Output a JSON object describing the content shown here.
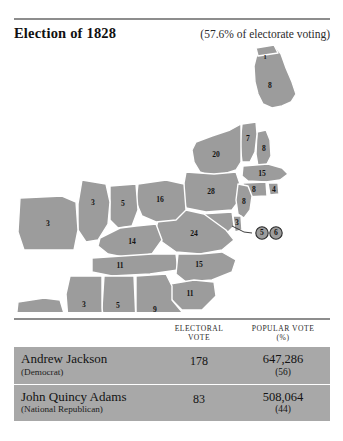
{
  "header": {
    "title": "Election of 1828",
    "turnout_note": "(57.6% of electorate voting)"
  },
  "map": {
    "fill_color": "#9c9c9c",
    "border_color": "#ffffff",
    "states": [
      {
        "code": "ME",
        "name": "Maine",
        "electoral_votes": "8",
        "x": 270,
        "y": 42
      },
      {
        "code": "MEn",
        "name": "Maine (split)",
        "electoral_votes": "1",
        "x": 265,
        "y": 14
      },
      {
        "code": "VT",
        "name": "Vermont",
        "electoral_votes": "7",
        "x": 248,
        "y": 89
      },
      {
        "code": "NH",
        "name": "New Hampshire",
        "electoral_votes": "8",
        "x": 264,
        "y": 105
      },
      {
        "code": "NY",
        "name": "New York",
        "electoral_votes": "20",
        "x": 224,
        "y": 111
      },
      {
        "code": "MA",
        "name": "Massachusetts",
        "electoral_votes": "15",
        "x": 265,
        "y": 130
      },
      {
        "code": "CT",
        "name": "Connecticut",
        "electoral_votes": "8",
        "x": 254,
        "y": 145
      },
      {
        "code": "RI",
        "name": "Rhode Island",
        "electoral_votes": "4",
        "x": 273,
        "y": 145
      },
      {
        "code": "PA",
        "name": "Pennsylvania",
        "electoral_votes": "28",
        "x": 211,
        "y": 148
      },
      {
        "code": "NJ",
        "name": "New Jersey",
        "electoral_votes": "8",
        "x": 244,
        "y": 161
      },
      {
        "code": "DE",
        "name": "Delaware",
        "electoral_votes": "3",
        "x": 237,
        "y": 180
      },
      {
        "code": "VA",
        "name": "Virginia",
        "electoral_votes": "24",
        "x": 197,
        "y": 190
      },
      {
        "code": "OH",
        "name": "Ohio",
        "electoral_votes": "16",
        "x": 158,
        "y": 158
      },
      {
        "code": "IN",
        "name": "Indiana",
        "electoral_votes": "5",
        "x": 122,
        "y": 163
      },
      {
        "code": "IL",
        "name": "Illinois",
        "electoral_votes": "3",
        "x": 95,
        "y": 160
      },
      {
        "code": "MO",
        "name": "Missouri",
        "electoral_votes": "3",
        "x": 61,
        "y": 182
      },
      {
        "code": "KY",
        "name": "Kentucky",
        "electoral_votes": "14",
        "x": 134,
        "y": 200
      },
      {
        "code": "TN",
        "name": "Tennessee",
        "electoral_votes": "11",
        "x": 120,
        "y": 223
      },
      {
        "code": "NC",
        "name": "North Carolina",
        "electoral_votes": "15",
        "x": 196,
        "y": 224
      },
      {
        "code": "SC",
        "name": "South Carolina",
        "electoral_votes": "11",
        "x": 182,
        "y": 250
      },
      {
        "code": "GA",
        "name": "Georgia",
        "electoral_votes": "9",
        "x": 150,
        "y": 268
      },
      {
        "code": "AL",
        "name": "Alabama",
        "electoral_votes": "5",
        "x": 117,
        "y": 264
      },
      {
        "code": "MS",
        "name": "Mississippi",
        "electoral_votes": "3",
        "x": 81,
        "y": 263
      },
      {
        "code": "LA",
        "name": "Louisiana",
        "electoral_votes": "5",
        "x": 37,
        "y": 284
      }
    ],
    "split_markers": [
      {
        "name": "Maryland split A",
        "electoral_votes": "5",
        "x": 262,
        "y": 189
      },
      {
        "name": "Maryland split B",
        "electoral_votes": "6",
        "x": 276,
        "y": 189
      }
    ]
  },
  "results_table": {
    "columns": {
      "candidate": "",
      "electoral_line1": "ELECTORAL",
      "electoral_line2": "VOTE",
      "popular_line1": "POPULAR VOTE",
      "popular_line2": "(%)"
    },
    "rows": [
      {
        "candidate": "Andrew Jackson",
        "party": "(Democrat)",
        "electoral_vote": "178",
        "popular_vote": "647,286",
        "popular_pct": "(56)"
      },
      {
        "candidate": "John Quincy Adams",
        "party": "(National Republican)",
        "electoral_vote": "83",
        "popular_vote": "508,064",
        "popular_pct": "(44)"
      }
    ]
  }
}
